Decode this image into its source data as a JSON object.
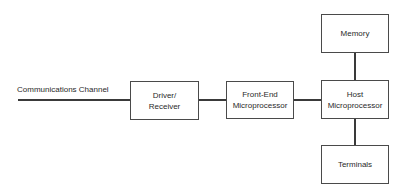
{
  "diagram": {
    "channel_label": "Communications Channel",
    "nodes": {
      "driver": {
        "line1": "Driver/",
        "line2": "Receiver"
      },
      "frontend": {
        "line1": "Front-End",
        "line2": "Microprocessor"
      },
      "host": {
        "line1": "Host",
        "line2": "Microprocessor"
      },
      "memory": {
        "label": "Memory"
      },
      "terminals": {
        "label": "Terminals"
      }
    },
    "edges": [
      {
        "from": "communications-channel",
        "to": "driver"
      },
      {
        "from": "driver",
        "to": "frontend"
      },
      {
        "from": "frontend",
        "to": "host"
      },
      {
        "from": "host",
        "to": "memory"
      },
      {
        "from": "host",
        "to": "terminals"
      }
    ]
  }
}
